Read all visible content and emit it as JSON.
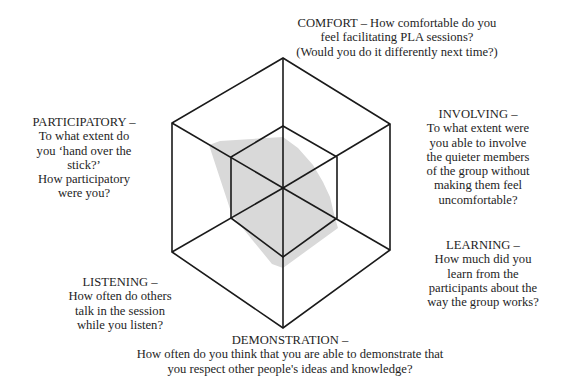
{
  "diagram": {
    "type": "hexagonal-spider-web",
    "colors": {
      "stroke": "#1a1a1a",
      "fill": "#d9d9d9",
      "background": "#ffffff"
    },
    "center": [
      283,
      188
    ],
    "outer_hexagon": [
      [
        283,
        58
      ],
      [
        390,
        124
      ],
      [
        390,
        250
      ],
      [
        283,
        328
      ],
      [
        172,
        252
      ],
      [
        172,
        123
      ]
    ],
    "inner_hexagon": [
      [
        283,
        126
      ],
      [
        337,
        157
      ],
      [
        337,
        218
      ],
      [
        283,
        257
      ],
      [
        231,
        218
      ],
      [
        231,
        157
      ]
    ],
    "shaded_polygon": [
      [
        209,
        145
      ],
      [
        220,
        141
      ],
      [
        283,
        137
      ],
      [
        298,
        148
      ],
      [
        313,
        165
      ],
      [
        323,
        182
      ],
      [
        330,
        197
      ],
      [
        335,
        218
      ],
      [
        338,
        228
      ],
      [
        283,
        268
      ],
      [
        272,
        264
      ],
      [
        232,
        215
      ]
    ]
  },
  "axes": [
    {
      "key": "comfort",
      "lines": [
        "COMFORT – How comfortable do you",
        "feel facilitating PLA sessions?",
        "(Would you do it differently next time?)"
      ]
    },
    {
      "key": "involving",
      "lines": [
        "INVOLVING –",
        "To what extent were",
        "you able to involve",
        "the quieter members",
        "of the group without",
        "making them feel",
        "uncomfortable?"
      ]
    },
    {
      "key": "learning",
      "lines": [
        "LEARNING –",
        "How much did you",
        "learn from the",
        "participants about the",
        "way the group works?"
      ]
    },
    {
      "key": "demonstration",
      "lines": [
        "DEMONSTRATION –",
        "How often do you think that you are able to demonstrate that",
        "you respect other people's ideas and knowledge?"
      ]
    },
    {
      "key": "listening",
      "lines": [
        "LISTENING –",
        "How often do others",
        "talk in the session",
        "while you listen?"
      ]
    },
    {
      "key": "participatory",
      "lines": [
        "PARTICIPATORY –",
        "To what extent do",
        "you ‘hand over the",
        "stick?’",
        "How participatory",
        "were you?"
      ]
    }
  ]
}
